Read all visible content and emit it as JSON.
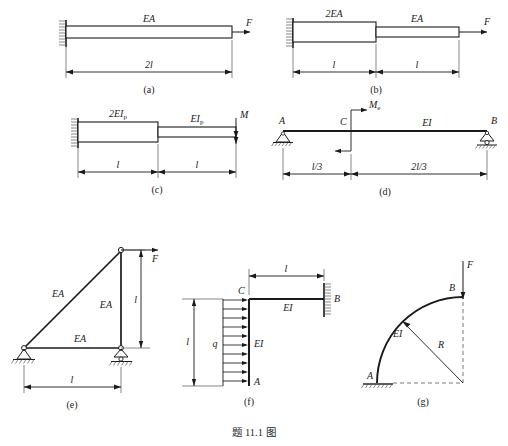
{
  "page": {
    "caption": "题 11.1 图"
  },
  "figures": [
    {
      "id": "a",
      "caption": "(a)",
      "labels": {
        "stiffness": "EA",
        "force": "F",
        "dimension": "2l"
      }
    },
    {
      "id": "b",
      "caption": "(b)",
      "labels": {
        "stiffness_left": "2EA",
        "stiffness_right": "EA",
        "force": "F",
        "dimension_left": "l",
        "dimension_right": "l"
      }
    },
    {
      "id": "c",
      "caption": "(c)",
      "labels": {
        "stiffness_left": "2EI",
        "stiffness_left_sub": "p",
        "stiffness_right": "EI",
        "stiffness_right_sub": "p",
        "moment": "M",
        "dimension_left": "l",
        "dimension_right": "l"
      }
    },
    {
      "id": "d",
      "caption": "(d)",
      "labels": {
        "node_a": "A",
        "node_b": "B",
        "node_c": "C",
        "moment": "M",
        "moment_sub": "e",
        "stiffness": "EI",
        "dimension_left": "l/3",
        "dimension_right": "2l/3"
      }
    },
    {
      "id": "e",
      "caption": "(e)",
      "labels": {
        "member_diagonal": "EA",
        "member_vertical": "EA",
        "member_horizontal": "EA",
        "force": "F",
        "dimension_height": "l",
        "dimension_span": "l"
      }
    },
    {
      "id": "f",
      "caption": "(f)",
      "labels": {
        "node_a": "A",
        "node_b": "B",
        "node_c": "C",
        "load": "q",
        "stiffness_vertical": "EI",
        "stiffness_horizontal": "EI",
        "dimension_height": "l",
        "dimension_span": "l"
      }
    },
    {
      "id": "g",
      "caption": "(g)",
      "labels": {
        "node_a": "A",
        "node_b": "B",
        "stiffness": "EI",
        "radius": "R",
        "force": "F"
      }
    }
  ],
  "colors": {
    "line": "#1a1a1a",
    "dim": "#3a3a3a",
    "text": "#1a1a1a"
  }
}
